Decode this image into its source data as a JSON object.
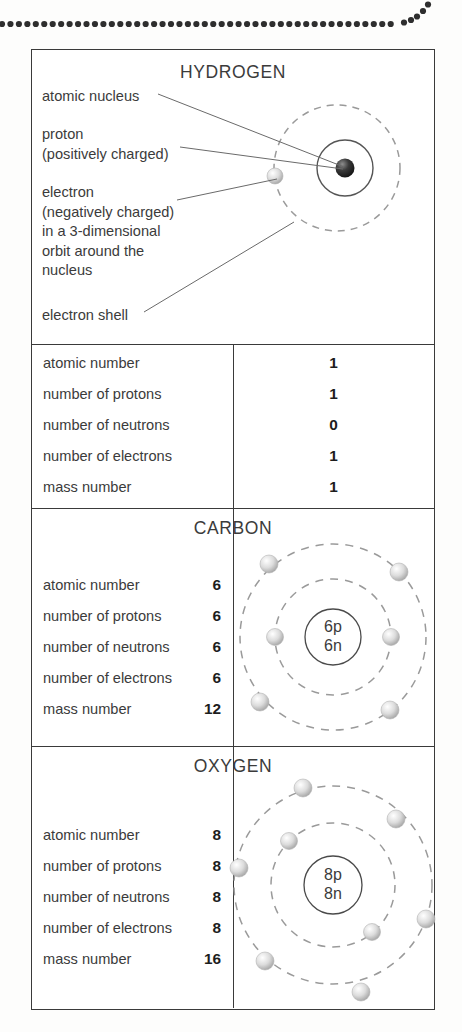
{
  "header": {
    "dotted_rule": "decorative-dotted-rule"
  },
  "figure": {
    "sections": [
      {
        "element": "HYDROGEN",
        "callouts": [
          "atomic nucleus",
          "proton\n(positively charged)",
          "electron\n(negatively charged)\nin a 3-dimensional\norbit around the\nnucleus",
          "electron shell"
        ],
        "properties": [
          {
            "label": "atomic number",
            "value": "1"
          },
          {
            "label": "number of protons",
            "value": "1"
          },
          {
            "label": "number of neutrons",
            "value": "0"
          },
          {
            "label": "number of electrons",
            "value": "1"
          },
          {
            "label": "mass number",
            "value": "1"
          }
        ],
        "nucleus_label": "",
        "shells": [
          1
        ]
      },
      {
        "element": "CARBON",
        "callouts": [],
        "properties": [
          {
            "label": "atomic number",
            "value": "6"
          },
          {
            "label": "number of protons",
            "value": "6"
          },
          {
            "label": "number of neutrons",
            "value": "6"
          },
          {
            "label": "number of electrons",
            "value": "6"
          },
          {
            "label": "mass number",
            "value": "12"
          }
        ],
        "nucleus_protons": "6p",
        "nucleus_neutrons": "6n",
        "shells": [
          2,
          4
        ]
      },
      {
        "element": "OXYGEN",
        "callouts": [],
        "properties": [
          {
            "label": "atomic number",
            "value": "8"
          },
          {
            "label": "number of protons",
            "value": "8"
          },
          {
            "label": "number of neutrons",
            "value": "8"
          },
          {
            "label": "number of electrons",
            "value": "8"
          },
          {
            "label": "mass number",
            "value": "16"
          }
        ],
        "nucleus_protons": "8p",
        "nucleus_neutrons": "8n",
        "shells": [
          2,
          6
        ]
      }
    ]
  },
  "colors": {
    "frame": "#3a3a3a",
    "text": "#3b3b3b",
    "value_text": "#1d1d1d",
    "shell_dash": "#9a9a9a",
    "electron": "#d8d8d8",
    "proton_dark": "#2b2b2b",
    "dot": "#2e2e2e"
  }
}
